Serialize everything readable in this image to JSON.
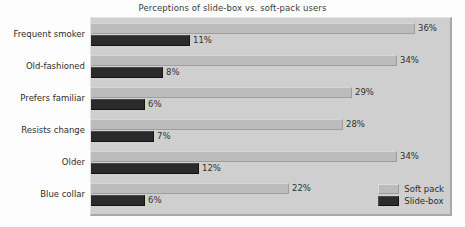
{
  "chart_data": {
    "type": "bar",
    "title": "Perceptions of slide-box vs. soft-pack users",
    "xlabel": "",
    "ylabel": "",
    "orientation": "horizontal",
    "grid": false,
    "legend_position": "bottom-right",
    "xlim": [
      0,
      40
    ],
    "value_suffix": "%",
    "categories": [
      "Frequent smoker",
      "Old-fashioned",
      "Prefers familiar",
      "Resists change",
      "Older",
      "Blue collar"
    ],
    "series": [
      {
        "name": "Soft pack",
        "color": "#bcbcbc",
        "values": [
          36,
          34,
          29,
          28,
          34,
          22
        ],
        "labels": [
          "36%",
          "34%",
          "29%",
          "28%",
          "34%",
          "22%"
        ]
      },
      {
        "name": "Slide-box",
        "color": "#2b2b2b",
        "values": [
          11,
          8,
          6,
          7,
          12,
          6
        ],
        "labels": [
          "11%",
          "8%",
          "6%",
          "7%",
          "12%",
          "6%"
        ]
      }
    ]
  },
  "legend": {
    "entries": [
      {
        "label": "Soft pack",
        "swatch": "soft"
      },
      {
        "label": "Slide-box",
        "swatch": "slide"
      }
    ]
  }
}
